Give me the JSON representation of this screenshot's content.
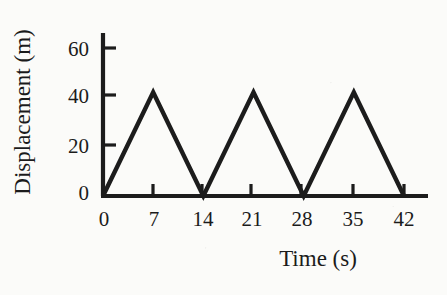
{
  "chart_data": {
    "type": "line",
    "title": "",
    "subtitle": "",
    "xlabel": "Time (s)",
    "ylabel": "Displacement (m)",
    "x": [
      0,
      7,
      14,
      21,
      28,
      35,
      42
    ],
    "values": [
      0,
      42,
      0,
      42,
      0,
      42,
      0
    ],
    "series": [
      {
        "name": "Displacement",
        "values": [
          0,
          42,
          0,
          42,
          0,
          42,
          0
        ]
      }
    ],
    "xticks": [
      "0",
      "7",
      "14",
      "21",
      "28",
      "35",
      "42"
    ],
    "xtick_values": [
      0,
      7,
      14,
      21,
      28,
      35,
      42
    ],
    "yticks": [
      "0",
      "20",
      "40",
      "60"
    ],
    "ytick_values": [
      0,
      20,
      40,
      60
    ],
    "xlim": [
      0,
      45
    ],
    "ylim": [
      0,
      66
    ],
    "grid": false,
    "legend": false,
    "legend_position": "none",
    "line_color": "#1c1c1c",
    "axis_color": "#1c1c1c",
    "background_color": "#fbfbf9",
    "annotations": []
  },
  "axes": {
    "y_title": "Displacement (m)",
    "x_title": "Time (s)",
    "y_tick_labels": [
      "60",
      "40",
      "20",
      "0"
    ],
    "x_tick_labels": [
      "0",
      "7",
      "14",
      "21",
      "28",
      "35",
      "42"
    ]
  }
}
